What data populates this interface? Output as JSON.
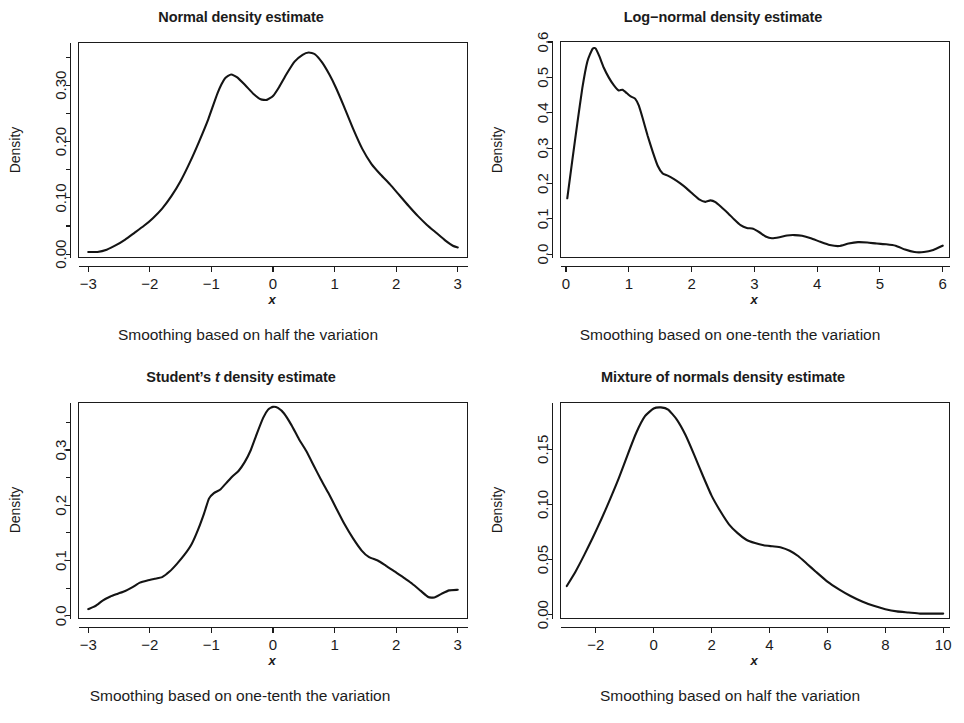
{
  "figure": {
    "background": "#ffffff",
    "ink": "#1b1b1b",
    "panel_count": 4
  },
  "panels": [
    {
      "id": "normal",
      "title": "Normal density estimate",
      "title_italic_token": "",
      "caption": "Smoothing based on half the variation",
      "xlabel": "x",
      "ylabel": "Density"
    },
    {
      "id": "lognormal",
      "title": "Log−normal density estimate",
      "title_italic_token": "",
      "caption": "Smoothing based on one-tenth the variation",
      "xlabel": "x",
      "ylabel": "Density"
    },
    {
      "id": "studentt",
      "title_pre": "Student’s ",
      "title_italic_token": "t",
      "title_post": " density estimate",
      "title": "Student’s t density estimate",
      "caption": "Smoothing based on one-tenth the variation",
      "xlabel": "x",
      "ylabel": "Density"
    },
    {
      "id": "mixture",
      "title": "Mixture of normals density estimate",
      "title_italic_token": "",
      "caption": "Smoothing based on half the variation",
      "xlabel": "x",
      "ylabel": "Density"
    }
  ],
  "chart_data": [
    {
      "type": "line",
      "id": "normal",
      "title": "Normal density estimate",
      "subtitle": "Smoothing based on half the variation",
      "xlabel": "x",
      "ylabel": "Density",
      "xlim": [
        -3.15,
        3.15
      ],
      "ylim": [
        -0.005,
        0.375
      ],
      "xticks": [
        -3,
        -2,
        -1,
        0,
        1,
        2,
        3
      ],
      "xticklabels": [
        "−3",
        "−2",
        "−1",
        "0",
        "1",
        "2",
        "3"
      ],
      "yticks": [
        0.0,
        0.05,
        0.1,
        0.15,
        0.2,
        0.25,
        0.3,
        0.35
      ],
      "ylabelled_ticks": [
        0.0,
        0.1,
        0.2,
        0.3
      ],
      "yticklabels": [
        "0.00",
        "0.10",
        "0.20",
        "0.30"
      ],
      "grid": false,
      "legend": "none",
      "x": [
        -3.0,
        -2.85,
        -2.7,
        -2.55,
        -2.4,
        -2.25,
        -2.1,
        -1.95,
        -1.8,
        -1.65,
        -1.5,
        -1.35,
        -1.2,
        -1.05,
        -0.9,
        -0.78,
        -0.68,
        -0.58,
        -0.45,
        -0.32,
        -0.2,
        -0.1,
        0.0,
        0.1,
        0.22,
        0.35,
        0.48,
        0.58,
        0.68,
        0.8,
        0.92,
        1.02,
        1.15,
        1.3,
        1.45,
        1.6,
        1.75,
        1.9,
        2.05,
        2.2,
        2.35,
        2.5,
        2.65,
        2.8,
        2.92,
        3.0
      ],
      "y": [
        0.004,
        0.004,
        0.008,
        0.016,
        0.026,
        0.038,
        0.05,
        0.064,
        0.081,
        0.103,
        0.13,
        0.163,
        0.2,
        0.24,
        0.286,
        0.312,
        0.319,
        0.314,
        0.3,
        0.285,
        0.275,
        0.274,
        0.281,
        0.297,
        0.32,
        0.342,
        0.354,
        0.358,
        0.355,
        0.34,
        0.318,
        0.296,
        0.263,
        0.223,
        0.187,
        0.16,
        0.141,
        0.124,
        0.105,
        0.086,
        0.068,
        0.052,
        0.038,
        0.024,
        0.015,
        0.012
      ]
    },
    {
      "type": "line",
      "id": "lognormal",
      "title": "Log−normal density estimate",
      "subtitle": "Smoothing based on one-tenth the variation",
      "xlabel": "x",
      "ylabel": "Density",
      "xlim": [
        -0.08,
        6.1
      ],
      "ylim": [
        -0.008,
        0.6
      ],
      "xticks": [
        0,
        1,
        2,
        3,
        4,
        5,
        6
      ],
      "xticklabels": [
        "0",
        "1",
        "2",
        "3",
        "4",
        "5",
        "6"
      ],
      "yticks": [
        0.0,
        0.1,
        0.2,
        0.3,
        0.4,
        0.5,
        0.6
      ],
      "ylabelled_ticks": [
        0.0,
        0.1,
        0.2,
        0.3,
        0.4,
        0.5,
        0.6
      ],
      "yticklabels": [
        "0.0",
        "0.1",
        "0.2",
        "0.3",
        "0.4",
        "0.5",
        "0.6"
      ],
      "grid": false,
      "legend": "none",
      "x": [
        0.02,
        0.1,
        0.18,
        0.26,
        0.34,
        0.42,
        0.47,
        0.53,
        0.6,
        0.68,
        0.76,
        0.84,
        0.9,
        0.97,
        1.03,
        1.1,
        1.16,
        1.22,
        1.3,
        1.38,
        1.46,
        1.54,
        1.62,
        1.72,
        1.82,
        1.92,
        2.02,
        2.12,
        2.22,
        2.3,
        2.38,
        2.48,
        2.58,
        2.68,
        2.78,
        2.88,
        2.98,
        3.08,
        3.18,
        3.28,
        3.4,
        3.52,
        3.64,
        3.76,
        3.9,
        4.05,
        4.2,
        4.35,
        4.5,
        4.65,
        4.8,
        4.95,
        5.1,
        5.25,
        5.4,
        5.55,
        5.7,
        5.85,
        6.0
      ],
      "y": [
        0.158,
        0.265,
        0.37,
        0.47,
        0.545,
        0.58,
        0.582,
        0.56,
        0.528,
        0.5,
        0.478,
        0.463,
        0.465,
        0.455,
        0.446,
        0.44,
        0.42,
        0.385,
        0.335,
        0.29,
        0.25,
        0.228,
        0.222,
        0.212,
        0.2,
        0.186,
        0.17,
        0.155,
        0.148,
        0.152,
        0.147,
        0.132,
        0.116,
        0.098,
        0.082,
        0.074,
        0.072,
        0.062,
        0.05,
        0.045,
        0.048,
        0.053,
        0.054,
        0.052,
        0.045,
        0.035,
        0.026,
        0.023,
        0.03,
        0.034,
        0.033,
        0.03,
        0.028,
        0.024,
        0.013,
        0.006,
        0.006,
        0.012,
        0.024
      ]
    },
    {
      "type": "line",
      "id": "studentt",
      "title": "Student’s t density estimate",
      "subtitle": "Smoothing based on one-tenth the variation",
      "xlabel": "x",
      "ylabel": "Density",
      "xlim": [
        -3.15,
        3.15
      ],
      "ylim": [
        -0.004,
        0.385
      ],
      "xticks": [
        -3,
        -2,
        -1,
        0,
        1,
        2,
        3
      ],
      "xticklabels": [
        "−3",
        "−2",
        "−1",
        "0",
        "1",
        "2",
        "3"
      ],
      "yticks": [
        0.0,
        0.05,
        0.1,
        0.15,
        0.2,
        0.25,
        0.3,
        0.35
      ],
      "ylabelled_ticks": [
        0.0,
        0.1,
        0.2,
        0.3
      ],
      "yticklabels": [
        "0.0",
        "0.1",
        "0.2",
        "0.3"
      ],
      "grid": false,
      "legend": "none",
      "x": [
        -3.0,
        -2.88,
        -2.76,
        -2.64,
        -2.52,
        -2.4,
        -2.28,
        -2.16,
        -2.04,
        -1.92,
        -1.8,
        -1.68,
        -1.56,
        -1.44,
        -1.32,
        -1.22,
        -1.12,
        -1.04,
        -0.96,
        -0.86,
        -0.76,
        -0.66,
        -0.56,
        -0.46,
        -0.36,
        -0.26,
        -0.16,
        -0.08,
        0.0,
        0.08,
        0.18,
        0.3,
        0.42,
        0.54,
        0.66,
        0.78,
        0.9,
        1.02,
        1.16,
        1.3,
        1.44,
        1.56,
        1.7,
        1.84,
        1.98,
        2.12,
        2.26,
        2.4,
        2.52,
        2.62,
        2.74,
        2.86,
        3.0
      ],
      "y": [
        0.012,
        0.018,
        0.028,
        0.035,
        0.04,
        0.045,
        0.052,
        0.06,
        0.064,
        0.067,
        0.07,
        0.08,
        0.094,
        0.11,
        0.13,
        0.155,
        0.185,
        0.212,
        0.222,
        0.228,
        0.24,
        0.252,
        0.262,
        0.278,
        0.3,
        0.33,
        0.358,
        0.373,
        0.378,
        0.376,
        0.366,
        0.345,
        0.32,
        0.298,
        0.272,
        0.246,
        0.222,
        0.196,
        0.166,
        0.14,
        0.118,
        0.106,
        0.1,
        0.09,
        0.08,
        0.069,
        0.058,
        0.045,
        0.034,
        0.033,
        0.04,
        0.046,
        0.047
      ]
    },
    {
      "type": "line",
      "id": "mixture",
      "title": "Mixture of normals density estimate",
      "subtitle": "Smoothing based on half the variation",
      "xlabel": "x",
      "ylabel": "Density",
      "xlim": [
        -3.2,
        10.2
      ],
      "ylim": [
        -0.003,
        0.192
      ],
      "xticks": [
        -2,
        0,
        2,
        4,
        6,
        8,
        10
      ],
      "xticklabels": [
        "−2",
        "0",
        "2",
        "4",
        "6",
        "8",
        "10"
      ],
      "yticks": [
        0.0,
        0.05,
        0.1,
        0.15
      ],
      "ylabelled_ticks": [
        0.0,
        0.05,
        0.1,
        0.15
      ],
      "yticklabels": [
        "0.00",
        "0.05",
        "0.10",
        "0.15"
      ],
      "grid": false,
      "legend": "none",
      "x": [
        -3.0,
        -2.7,
        -2.4,
        -2.1,
        -1.8,
        -1.5,
        -1.2,
        -0.9,
        -0.6,
        -0.3,
        0.0,
        0.25,
        0.5,
        0.8,
        1.1,
        1.4,
        1.7,
        2.0,
        2.3,
        2.6,
        2.9,
        3.2,
        3.5,
        3.8,
        4.1,
        4.4,
        4.7,
        5.0,
        5.3,
        5.6,
        6.0,
        6.4,
        6.8,
        7.2,
        7.6,
        8.0,
        8.4,
        8.8,
        9.2,
        9.6,
        10.0
      ],
      "y": [
        0.026,
        0.039,
        0.054,
        0.07,
        0.087,
        0.105,
        0.124,
        0.145,
        0.165,
        0.18,
        0.187,
        0.188,
        0.186,
        0.177,
        0.163,
        0.145,
        0.126,
        0.108,
        0.094,
        0.082,
        0.074,
        0.068,
        0.065,
        0.063,
        0.062,
        0.061,
        0.058,
        0.053,
        0.046,
        0.039,
        0.03,
        0.023,
        0.017,
        0.012,
        0.008,
        0.005,
        0.003,
        0.002,
        0.001,
        0.001,
        0.001
      ]
    }
  ]
}
